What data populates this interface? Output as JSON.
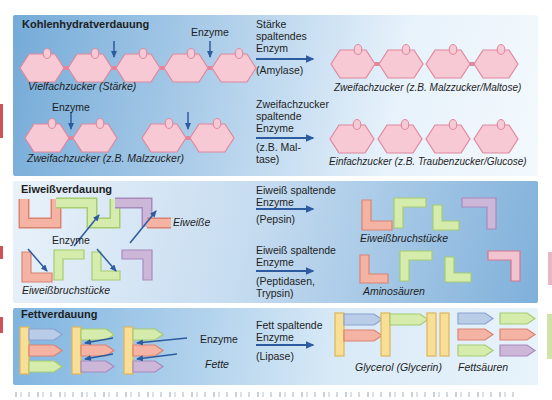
{
  "figure": {
    "sections": {
      "carbs": {
        "title": "Kohlenhydratverdauung",
        "enzyme_label_top": "Enzyme",
        "enzyme_label_bottom": "Enzyme",
        "starch_label": "Vielfachzucker (Stärke)",
        "step1_enzyme": [
          "Stärke",
          "spaltendes",
          "Enzym"
        ],
        "step1_enzyme_name": "(Amylase)",
        "maltose_product_label": "Zweifachzucker (z.B. Malzzucker/Maltose)",
        "maltose_substrate_label": "Zweifachzucker (z.B. Malzzucker)",
        "step2_enzyme": [
          "Zweifachzucker",
          "spaltende",
          "Enzyme"
        ],
        "step2_enzyme_name": [
          "(z.B. Mal-",
          "tase)"
        ],
        "glucose_product_label": "Einfachzucker (z.B. Traubenzucker/Glucose)"
      },
      "protein": {
        "title": "Eiweißverdauung",
        "substrate_label": "Eiweiße",
        "enzyme_label": "Enzyme",
        "fragments_label": "Eiweißbruchstücke",
        "step1_enzyme": [
          "Eiweiß spaltende",
          "Enzyme"
        ],
        "step1_enzyme_name": "(Pepsin)",
        "step1_product_label": "Eiweißbruchstücke",
        "step2_enzyme": [
          "Eiweiß spaltende",
          "Enzyme"
        ],
        "step2_enzyme_name": [
          "(Peptidasen,",
          "Trypsin)"
        ],
        "step2_product_label": "Aminosäuren"
      },
      "fat": {
        "title": "Fettverdauung",
        "enzyme_label": "Enzyme",
        "substrate_label": "Fette",
        "step_enzyme": [
          "Fett spaltende",
          "Enzyme"
        ],
        "step_enzyme_name": "(Lipase)",
        "product_label_glycerol": "Glycerol (Glycerin)",
        "product_label_fatty_acids": "Fettsäuren"
      }
    },
    "palette": {
      "arrow_blue": "#2e5b9f",
      "sugar_fill": "#f7c9d5",
      "sugar_border": "#e0879d",
      "salmon_fill": "#f4b3a3",
      "salmon_border": "#db8372",
      "green_fill": "#d6ecac",
      "green_border": "#a6cc70",
      "purple_fill": "#cdb7d9",
      "purple_border": "#a78abc",
      "rose_fill": "#f2c4d0",
      "rose_border": "#d3758f",
      "fat_yellow_fill": "#f8df95",
      "fat_yellow_border": "#dcb65e",
      "fat_blue_fill": "#b9cde9",
      "fat_blue_border": "#8aa3cf",
      "edge_red": "#cf5356",
      "edge_pink": "#eab6c3",
      "edge_green": "#cfe3a9"
    }
  }
}
